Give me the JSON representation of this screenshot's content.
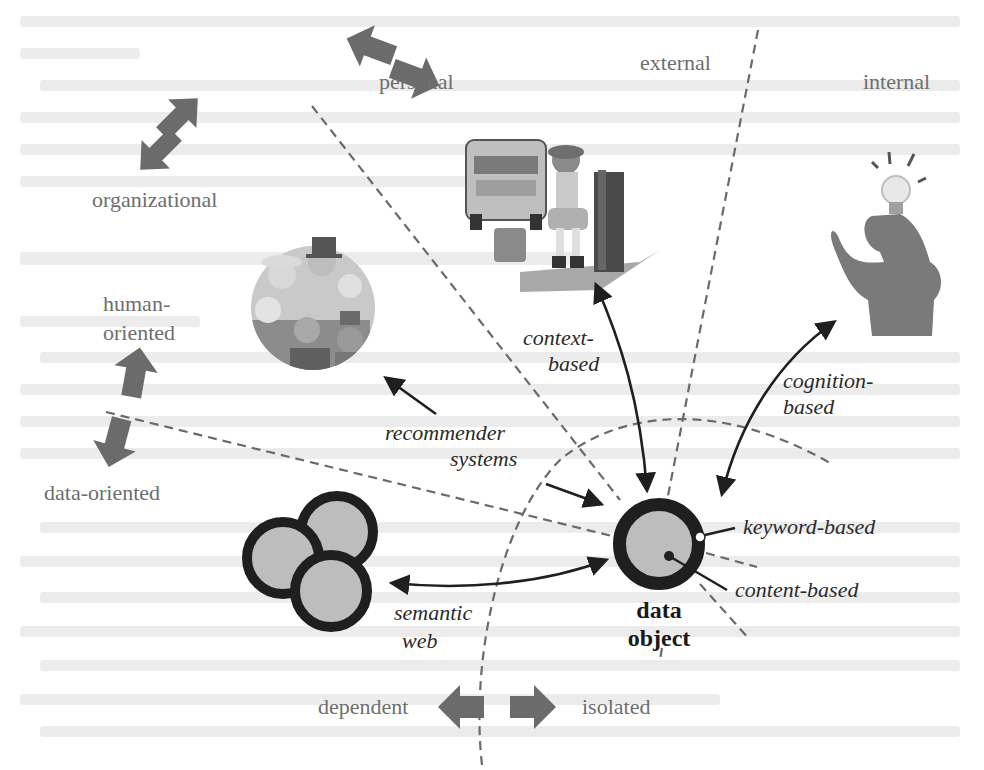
{
  "diagram": {
    "center": {
      "label_line1": "data",
      "label_line2": "object",
      "x": 659,
      "y": 544,
      "outer_r": 46,
      "inner_r": 33,
      "keyword_label": "keyword-based",
      "content_label": "content-based"
    },
    "approaches": [
      {
        "id": "context",
        "line1": "context-",
        "line2": "based"
      },
      {
        "id": "cognition",
        "line1": "cognition-",
        "line2": "based"
      },
      {
        "id": "recommender",
        "line1": "recommender",
        "line2": "systems"
      },
      {
        "id": "semantic",
        "line1": "semantic",
        "line2": "web"
      }
    ],
    "dimensions": [
      {
        "id": "personal-organizational",
        "a": "personal",
        "b": "organizational"
      },
      {
        "id": "external-internal",
        "a": "external",
        "b": "internal"
      },
      {
        "id": "human-data",
        "a1": "human-",
        "a2": "oriented",
        "b": "data-oriented"
      },
      {
        "id": "dependent-isolated",
        "a": "dependent",
        "b": "isolated"
      }
    ],
    "illustrations": [
      {
        "id": "people-group",
        "desc": "group of people"
      },
      {
        "id": "bus-stop",
        "desc": "girl waiting at bus stop"
      },
      {
        "id": "thinker",
        "desc": "person with light bulb"
      },
      {
        "id": "linked-data",
        "desc": "three overlapping circles"
      }
    ],
    "colors": {
      "ink": "#1f1f1f",
      "fill_gray": "#bdbdbd",
      "arrow_gray": "#6b6b6b",
      "dim_text": "#6e6e6e"
    }
  }
}
